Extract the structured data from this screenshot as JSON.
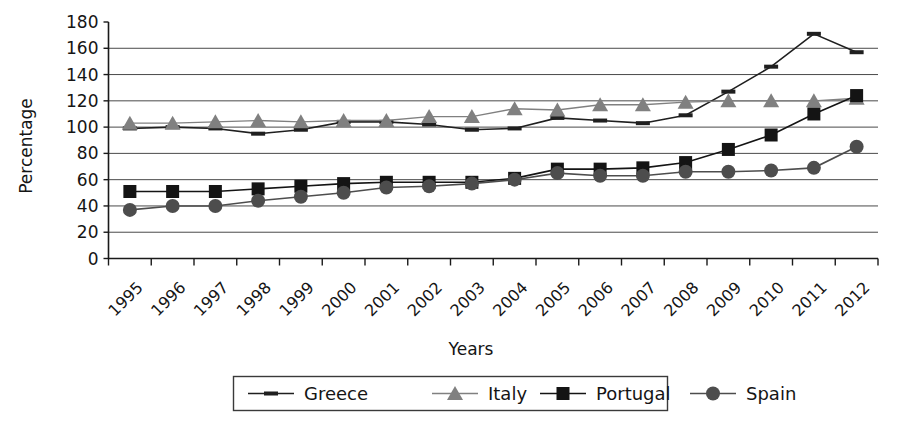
{
  "chart_data": {
    "type": "line",
    "title": "",
    "xlabel": "Years",
    "ylabel": "Percentage",
    "categories": [
      "1995",
      "1996",
      "1997",
      "1998",
      "1999",
      "2000",
      "2001",
      "2002",
      "2003",
      "2004",
      "2005",
      "2006",
      "2007",
      "2008",
      "2009",
      "2010",
      "2011",
      "2012"
    ],
    "ylim": [
      0,
      180
    ],
    "yticks": [
      0,
      20,
      40,
      60,
      80,
      100,
      120,
      140,
      160,
      180
    ],
    "grid": true,
    "legend_position": "bottom",
    "series": [
      {
        "name": "Greece",
        "marker": "dash",
        "color": "#1f1f1f",
        "values": [
          99,
          100,
          99,
          95,
          98,
          104,
          104,
          102,
          98,
          99,
          107,
          105,
          103,
          109,
          127,
          146,
          171,
          157
        ]
      },
      {
        "name": "Italy",
        "marker": "triangle",
        "color": "#808080",
        "values": [
          103,
          103,
          104,
          105,
          104,
          105,
          105,
          108,
          108,
          114,
          113,
          117,
          117,
          119,
          120,
          120,
          120,
          122
        ]
      },
      {
        "name": "Portugal",
        "marker": "square",
        "color": "#141414",
        "values": [
          51,
          51,
          51,
          53,
          55,
          57,
          58,
          58,
          58,
          61,
          68,
          68,
          69,
          73,
          83,
          94,
          110,
          124
        ]
      },
      {
        "name": "Spain",
        "marker": "circle",
        "color": "#4d4d4d",
        "values": [
          37,
          40,
          40,
          44,
          47,
          50,
          54,
          55,
          57,
          60,
          65,
          63,
          63,
          66,
          66,
          67,
          69,
          85
        ]
      }
    ]
  },
  "legend": {
    "entries": [
      {
        "label": "Greece"
      },
      {
        "label": "Italy"
      },
      {
        "label": "Portugal"
      },
      {
        "label": "Spain"
      }
    ]
  },
  "axes": {
    "y_title": "Percentage",
    "x_title": "Years"
  }
}
